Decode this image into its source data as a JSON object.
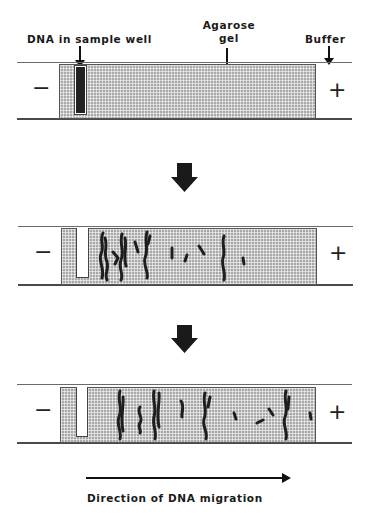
{
  "labels": {
    "dna_in_sample_well": "DNA in sample well",
    "agarose_line1": "Agarose",
    "agarose_line2": "gel",
    "buffer": "Buffer",
    "direction": "Direction of DNA migration"
  },
  "electrodes": {
    "negative": "−",
    "positive": "+"
  },
  "colors": {
    "gel": "#a9a9a9",
    "dna": "#1e1e1e",
    "line": "#555555",
    "background": "#ffffff"
  },
  "panels": [
    {
      "stage": "start",
      "description": "DNA loaded in sample well"
    },
    {
      "stage": "mid",
      "description": "DNA fragments begin to separate"
    },
    {
      "stage": "end",
      "description": "DNA fragments separated by size"
    }
  ]
}
